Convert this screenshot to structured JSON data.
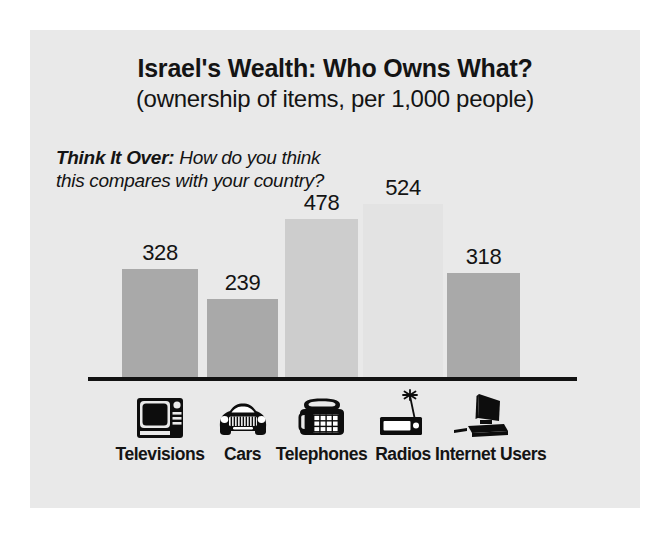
{
  "chart_data": {
    "type": "bar",
    "title": "Israel's Wealth: Who Owns What?",
    "subtitle": "(ownership of items, per 1,000 people)",
    "xlabel": "",
    "ylabel": "",
    "ylim": [
      0,
      600
    ],
    "grid": false,
    "legend": false,
    "categories": [
      "Televisions",
      "Cars",
      "Telephones",
      "Radios",
      "Internet Users"
    ],
    "values": [
      328,
      239,
      478,
      524,
      318
    ],
    "value_labels": [
      "328",
      "239",
      "478",
      "524",
      "318"
    ],
    "bar_colors": [
      "#a9a9a9",
      "#a9a9a9",
      "#cdcdcd",
      "#e3e3e3",
      "#a9a9a9"
    ],
    "icons": [
      "television-icon",
      "car-icon",
      "telephone-icon",
      "radio-icon",
      "computer-icon"
    ],
    "annotations": [
      {
        "name": "think-it-over-note",
        "lead": "Think It Over:",
        "text": " How do you think this compares with your country?"
      }
    ]
  },
  "colors": {
    "page_background": "#ffffff",
    "card_background": "#e9e9e9",
    "text": "#141414",
    "baseline": "#121212",
    "icon": "#0d0d0d"
  }
}
